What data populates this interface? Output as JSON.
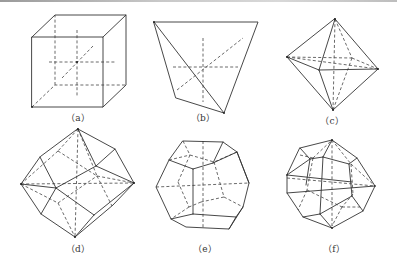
{
  "figure": {
    "panels": [
      {
        "id": "a",
        "label": "（a）",
        "shape": "cube"
      },
      {
        "id": "b",
        "label": "（b）",
        "shape": "tetrahedron"
      },
      {
        "id": "c",
        "label": "（c）",
        "shape": "octahedron"
      },
      {
        "id": "d",
        "label": "（d）",
        "shape": "rhombic-dodecahedron"
      },
      {
        "id": "e",
        "label": "（e）",
        "shape": "pentagonal-dodecahedron"
      },
      {
        "id": "f",
        "label": "（f）",
        "shape": "trapezohedron"
      }
    ],
    "colors": {
      "line": "#333333",
      "background": "#ffffff"
    }
  }
}
